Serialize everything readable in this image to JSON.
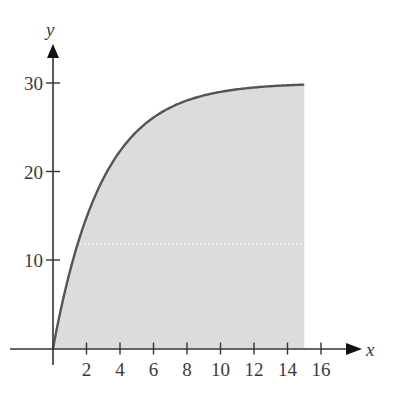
{
  "chart_data": {
    "type": "area",
    "title": "",
    "xlabel": "x",
    "ylabel": "y",
    "function": "y = 30(1 - e^(-0.34x))",
    "shaded_region": {
      "x_from": 0,
      "x_to": 15,
      "description": "area under curve from x=0 to x=15"
    },
    "xlim": [
      0,
      16
    ],
    "ylim": [
      0,
      30
    ],
    "x_ticks": [
      2,
      4,
      6,
      8,
      10,
      12,
      14,
      16
    ],
    "y_ticks": [
      10,
      20,
      30
    ],
    "x": [
      0,
      1,
      2,
      3,
      4,
      5,
      6,
      7,
      8,
      9,
      10,
      11,
      12,
      13,
      14,
      15
    ],
    "values": [
      0,
      8.6,
      14.8,
      19.2,
      22.1,
      24.5,
      26.1,
      27.2,
      28.0,
      28.6,
      29.0,
      29.3,
      29.5,
      29.6,
      29.7,
      29.8
    ],
    "grid": false,
    "legend": null,
    "colors": {
      "fill": "#dcdcdc",
      "curve": "#555555",
      "axis": "#333333"
    }
  },
  "labels": {
    "x_axis": "x",
    "y_axis": "y",
    "x_ticks": [
      "2",
      "4",
      "6",
      "8",
      "10",
      "12",
      "14",
      "16"
    ],
    "y_ticks": [
      "10",
      "20",
      "30"
    ]
  }
}
